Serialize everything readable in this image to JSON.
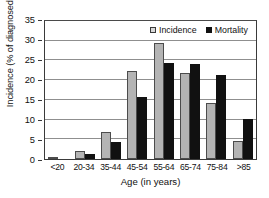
{
  "chart_data": {
    "type": "bar",
    "title": "",
    "xlabel": "Age (in years)",
    "ylabel": "Incidence (% of diagnosed cases)",
    "categories": [
      "<20",
      "20-34",
      "35-44",
      "45-54",
      "55-64",
      "65-74",
      "75-84",
      ">85"
    ],
    "series": [
      {
        "name": "Incidence",
        "color": "#b4b4b4",
        "values": [
          0.2,
          2.1,
          6.7,
          22.0,
          28.9,
          21.6,
          14.1,
          4.4
        ]
      },
      {
        "name": "Mortality",
        "color": "#111111",
        "values": [
          0.0,
          1.2,
          4.2,
          15.4,
          24.0,
          23.8,
          20.9,
          10.0
        ]
      }
    ],
    "ylim": [
      0,
      35
    ],
    "yticks": [
      0,
      5,
      10,
      15,
      20,
      25,
      30,
      35
    ],
    "ytick_labels": [
      "0",
      "5",
      "10",
      "15",
      "20",
      "25",
      "30",
      "35"
    ],
    "grid": true,
    "grid_axis": "y",
    "legend_position": "top-right"
  },
  "legend": {
    "entries": [
      {
        "label": "Incidence",
        "swatch": "incidence-swatch-icon"
      },
      {
        "label": "Mortality",
        "swatch": "mortality-swatch-icon"
      }
    ]
  }
}
